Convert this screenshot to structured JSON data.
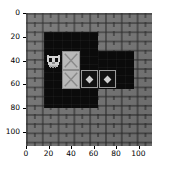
{
  "figure": {
    "kind": "matplotlib-image-plot",
    "width_px": 174,
    "height_px": 178,
    "background_color": "#ffffff"
  },
  "axes": {
    "x_ticks": [
      "0",
      "20",
      "40",
      "60",
      "80",
      "100"
    ],
    "y_ticks": [
      "0",
      "20",
      "40",
      "60",
      "80",
      "100"
    ],
    "x_tick_values": [
      0,
      20,
      40,
      60,
      80,
      100
    ],
    "y_tick_values": [
      0,
      20,
      40,
      60,
      80,
      100
    ],
    "xlim": [
      0,
      112
    ],
    "ylim": [
      112,
      0
    ],
    "xlabel": "",
    "ylabel": "",
    "title": "",
    "grid": false,
    "tick_color": "#000000",
    "frame_left_px": 26,
    "frame_top_px": 13,
    "frame_width_px": 126,
    "frame_height_px": 133
  },
  "scene": {
    "name": "sokoban-grid",
    "tile_size": 16,
    "grid_cols": 7,
    "grid_rows": 7,
    "colors": {
      "wall": "#767676",
      "wall_mortar": "#3a3a3a",
      "floor": "#0b0b0b",
      "box": "#b9b9b9",
      "box_edge": "#8c8c8c",
      "target_edge": "#9a9a9a",
      "player": "#d9d9d9"
    },
    "floor_regions": [
      {
        "name": "main-room",
        "x": 16,
        "y": 16,
        "w": 48,
        "h": 64
      },
      {
        "name": "right-corridor",
        "x": 64,
        "y": 32,
        "w": 32,
        "h": 32
      }
    ],
    "player": {
      "name": "owl-player",
      "x": 16,
      "y": 32,
      "w": 16,
      "h": 16,
      "facing": "down"
    },
    "boxes": [
      {
        "name": "box-upper",
        "x": 32,
        "y": 32,
        "w": 16,
        "h": 16,
        "marker": "x-cross"
      },
      {
        "name": "box-lower",
        "x": 32,
        "y": 48,
        "w": 16,
        "h": 16,
        "marker": "x-cross"
      }
    ],
    "targets": [
      {
        "name": "target-left",
        "x": 48,
        "y": 48,
        "w": 16,
        "h": 16,
        "marker": "diamond"
      },
      {
        "name": "target-right",
        "x": 64,
        "y": 48,
        "w": 16,
        "h": 16,
        "marker": "diamond"
      }
    ]
  }
}
